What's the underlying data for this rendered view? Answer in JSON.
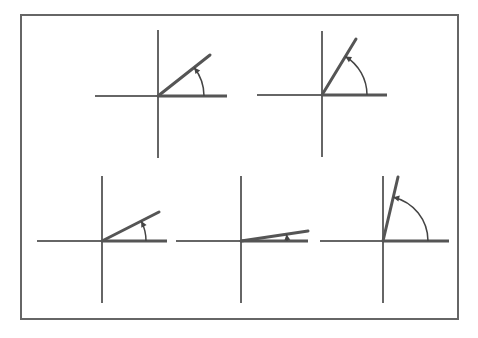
{
  "colors": {
    "background": "#ffffff",
    "border": "#666666",
    "axis": "#333333",
    "ray": "#555555",
    "arc": "#444444"
  },
  "frame": {
    "x1": 21,
    "y1": 15,
    "x2": 458,
    "y2": 319
  },
  "diagrams": [
    {
      "name": "angle-diagram-1",
      "origin": [
        158,
        96
      ],
      "x_axis": [
        95,
        227
      ],
      "y_axis": [
        30,
        158
      ],
      "ray_end": [
        210,
        55
      ],
      "arc_radius": 46
    },
    {
      "name": "angle-diagram-2",
      "origin": [
        322,
        95
      ],
      "x_axis": [
        257,
        387
      ],
      "y_axis": [
        31,
        157
      ],
      "ray_end": [
        356,
        39
      ],
      "arc_radius": 45
    },
    {
      "name": "angle-diagram-3",
      "origin": [
        102,
        241
      ],
      "x_axis": [
        37,
        167
      ],
      "y_axis": [
        176,
        303
      ],
      "ray_end": [
        159,
        212
      ],
      "arc_radius": 44
    },
    {
      "name": "angle-diagram-4",
      "origin": [
        241,
        241
      ],
      "x_axis": [
        176,
        308
      ],
      "y_axis": [
        176,
        303
      ],
      "ray_end": [
        308,
        231
      ],
      "arc_radius": 46
    },
    {
      "name": "angle-diagram-5",
      "origin": [
        383,
        241
      ],
      "x_axis": [
        320,
        449
      ],
      "y_axis": [
        176,
        303
      ],
      "ray_end": [
        398,
        177
      ],
      "arc_radius": 45
    }
  ]
}
